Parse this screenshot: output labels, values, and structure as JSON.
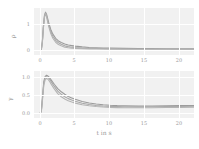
{
  "chart_data": [
    {
      "panel": "top",
      "type": "line",
      "title": "",
      "xlabel": "",
      "ylabel": "ρ",
      "xlim": [
        -0.9,
        22.0
      ],
      "ylim": [
        -0.18,
        1.62
      ],
      "xticks": [
        0,
        5,
        10,
        15,
        20
      ],
      "xticklabels": [
        "0",
        "5",
        "10",
        "15",
        "20"
      ],
      "yticks": [
        0,
        1
      ],
      "yticklabels": [
        "0",
        "1"
      ],
      "grid": true,
      "legend": "none",
      "series": [
        {
          "name": "rho-upper",
          "color": "#9b9b9b",
          "x": [
            0.0,
            0.15,
            0.3,
            0.45,
            0.6,
            0.75,
            0.9,
            1.05,
            1.2,
            1.5,
            1.8,
            2.2,
            2.6,
            3.0,
            3.5,
            4.0,
            4.5,
            5.0,
            6.0,
            7.0,
            8.0,
            9.0,
            10.0,
            12.0,
            14.0,
            16.0,
            18.0,
            20.0,
            22.0
          ],
          "y": [
            0.0,
            0.02,
            0.35,
            0.95,
            1.34,
            1.46,
            1.38,
            1.22,
            1.06,
            0.8,
            0.62,
            0.46,
            0.36,
            0.3,
            0.24,
            0.2,
            0.18,
            0.16,
            0.13,
            0.11,
            0.1,
            0.09,
            0.085,
            0.075,
            0.07,
            0.065,
            0.06,
            0.058,
            0.055
          ]
        },
        {
          "name": "rho-mid",
          "color": "#a8a8a8",
          "x": [
            0.0,
            0.15,
            0.3,
            0.45,
            0.6,
            0.75,
            0.9,
            1.05,
            1.2,
            1.5,
            1.8,
            2.2,
            2.6,
            3.0,
            3.5,
            4.0,
            4.5,
            5.0,
            6.0,
            7.0,
            8.0,
            9.0,
            10.0,
            12.0,
            14.0,
            16.0,
            18.0,
            20.0,
            22.0
          ],
          "y": [
            0.0,
            0.02,
            0.32,
            0.9,
            1.3,
            1.43,
            1.33,
            1.16,
            0.99,
            0.72,
            0.54,
            0.38,
            0.29,
            0.23,
            0.17,
            0.14,
            0.12,
            0.105,
            0.085,
            0.075,
            0.068,
            0.063,
            0.06,
            0.055,
            0.052,
            0.05,
            0.048,
            0.047,
            0.046
          ]
        },
        {
          "name": "rho-lower",
          "color": "#b4b4b4",
          "x": [
            0.0,
            0.15,
            0.3,
            0.45,
            0.6,
            0.75,
            0.9,
            1.05,
            1.2,
            1.5,
            1.8,
            2.2,
            2.6,
            3.0,
            3.5,
            4.0,
            4.5,
            5.0,
            6.0,
            7.0,
            8.0,
            9.0,
            10.0,
            12.0,
            14.0,
            16.0,
            18.0,
            20.0,
            22.0
          ],
          "y": [
            0.0,
            0.02,
            0.3,
            0.86,
            1.26,
            1.4,
            1.28,
            1.1,
            0.92,
            0.64,
            0.46,
            0.31,
            0.22,
            0.17,
            0.12,
            0.1,
            0.085,
            0.075,
            0.06,
            0.053,
            0.05,
            0.047,
            0.045,
            0.042,
            0.04,
            0.039,
            0.038,
            0.037,
            0.036
          ]
        }
      ]
    },
    {
      "panel": "bottom",
      "type": "line",
      "title": "",
      "xlabel": "t in s",
      "ylabel": "γ",
      "xlim": [
        -0.9,
        22.0
      ],
      "ylim": [
        -0.13,
        1.18
      ],
      "xticks": [
        0,
        5,
        10,
        15,
        20
      ],
      "xticklabels": [
        "0",
        "5",
        "10",
        "15",
        "20"
      ],
      "yticks": [
        0.0,
        0.5,
        1.0
      ],
      "yticklabels": [
        "0.0",
        "0.5",
        "1.0"
      ],
      "grid": true,
      "legend": "none",
      "series": [
        {
          "name": "gamma-upper",
          "color": "#9b9b9b",
          "x": [
            0.0,
            0.15,
            0.3,
            0.5,
            0.7,
            0.9,
            1.1,
            1.3,
            1.6,
            2.0,
            2.5,
            3.0,
            3.5,
            4.0,
            4.5,
            5.0,
            6.0,
            7.0,
            8.0,
            9.0,
            10.0,
            11.0,
            12.0,
            14.0,
            16.0,
            18.0,
            20.0,
            22.0
          ],
          "y": [
            0.03,
            0.08,
            0.42,
            0.88,
            1.03,
            1.06,
            1.04,
            1.0,
            0.92,
            0.81,
            0.69,
            0.6,
            0.53,
            0.47,
            0.43,
            0.39,
            0.33,
            0.29,
            0.26,
            0.24,
            0.225,
            0.215,
            0.21,
            0.205,
            0.205,
            0.21,
            0.215,
            0.22
          ]
        },
        {
          "name": "gamma-mid",
          "color": "#a8a8a8",
          "x": [
            0.0,
            0.15,
            0.3,
            0.5,
            0.7,
            0.9,
            1.1,
            1.3,
            1.6,
            2.0,
            2.5,
            3.0,
            3.5,
            4.0,
            4.5,
            5.0,
            6.0,
            7.0,
            8.0,
            9.0,
            10.0,
            11.0,
            12.0,
            14.0,
            16.0,
            18.0,
            20.0,
            22.0
          ],
          "y": [
            0.02,
            0.06,
            0.38,
            0.83,
            0.99,
            1.02,
            1.0,
            0.96,
            0.87,
            0.75,
            0.62,
            0.53,
            0.46,
            0.41,
            0.37,
            0.335,
            0.28,
            0.245,
            0.22,
            0.205,
            0.195,
            0.188,
            0.184,
            0.18,
            0.182,
            0.186,
            0.192,
            0.198
          ]
        },
        {
          "name": "gamma-lower",
          "color": "#b4b4b4",
          "x": [
            0.0,
            0.15,
            0.3,
            0.5,
            0.7,
            0.9,
            1.1,
            1.3,
            1.6,
            2.0,
            2.5,
            3.0,
            3.5,
            4.0,
            4.5,
            5.0,
            6.0,
            7.0,
            8.0,
            9.0,
            10.0,
            11.0,
            12.0,
            14.0,
            16.0,
            18.0,
            20.0,
            22.0
          ],
          "y": [
            0.0,
            0.04,
            0.34,
            0.78,
            0.94,
            0.97,
            0.95,
            0.9,
            0.8,
            0.68,
            0.55,
            0.46,
            0.4,
            0.35,
            0.315,
            0.285,
            0.24,
            0.21,
            0.19,
            0.175,
            0.166,
            0.16,
            0.157,
            0.155,
            0.157,
            0.161,
            0.167,
            0.174
          ]
        }
      ]
    }
  ],
  "axis_colors": {
    "plot_background": "#f1f1f1",
    "gridline": "#ffffff",
    "tick_text": "#9a9a9a",
    "curve_gray": "#a8a8a8"
  }
}
